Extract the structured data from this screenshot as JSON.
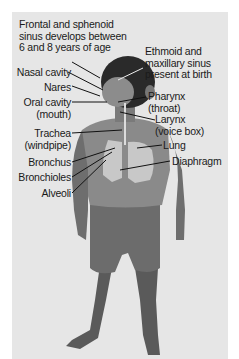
{
  "figure": {
    "type": "anatomical-diagram",
    "background_color": "#e6e6e6"
  },
  "labels": {
    "frontal_sinus": {
      "line1": "Frontal and sphenoid",
      "line2": "sinus develops between",
      "line3": "6 and 8 years of age"
    },
    "ethmoid_sinus": {
      "line1": "Ethmoid and",
      "line2": "maxillary sinus",
      "line3": "present at birth"
    },
    "nasal_cavity": "Nasal cavity",
    "nares": "Nares",
    "oral_cavity": {
      "line1": "Oral cavity",
      "line2": "(mouth)"
    },
    "pharynx": {
      "line1": "Pharynx",
      "line2": "(throat)"
    },
    "larynx": {
      "line1": "Larynx",
      "line2": "(voice box)"
    },
    "trachea": {
      "line1": "Trachea",
      "line2": "(windpipe)"
    },
    "lung": "Lung",
    "bronchus": "Bronchus",
    "diaphragm": "Diaphragm",
    "bronchioles": "Bronchioles",
    "alveoli": "Alveoli"
  }
}
